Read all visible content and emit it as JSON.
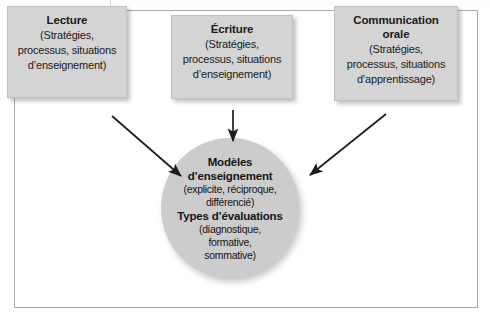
{
  "diagram": {
    "title_hidden": "",
    "boxes": [
      {
        "id": "lecture",
        "title": "Lecture",
        "line1": "(Stratégies,",
        "line2": "processus, situations",
        "line3": "d’enseignement)"
      },
      {
        "id": "ecriture",
        "title": "Écriture",
        "line1": "(Stratégies,",
        "line2": "processus, situations",
        "line3": "d’enseignement)"
      },
      {
        "id": "communication-orale",
        "title_line1": "Communication",
        "title_line2": "orale",
        "line1": "(Stratégies,",
        "line2": "processus, situations",
        "line3": "d’apprentissage)"
      }
    ],
    "center": {
      "heading1_line1": "Modèles",
      "heading1_line2": "d’enseignement",
      "detail1_line1": "(explicite, réciproque,",
      "detail1_line2": "différencié)",
      "heading2": "Types d’évaluations",
      "detail2_line1": "(diagnostique,",
      "detail2_line2": "formative,",
      "detail2_line3": "sommative)"
    },
    "arrows": [
      {
        "id": "lecture-to-center",
        "from": "lecture",
        "to": "center",
        "direction": "diagonal-down-right"
      },
      {
        "id": "ecriture-to-center",
        "from": "ecriture",
        "to": "center",
        "direction": "down"
      },
      {
        "id": "communication-to-center",
        "from": "communication-orale",
        "to": "center",
        "direction": "diagonal-down-left"
      }
    ],
    "colors": {
      "box_fill": "#d4d4d4",
      "circle_fill": "#cccccc",
      "frame_border": "#a9a9a9",
      "text": "#1a1a1a",
      "arrow": "#1c1c1c",
      "background": "#ffffff"
    }
  }
}
